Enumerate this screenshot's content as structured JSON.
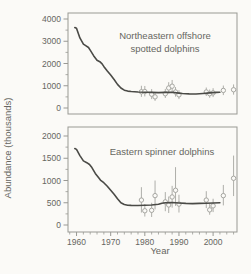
{
  "figure": {
    "y_axis_label": "Abundance (thousands)",
    "x_axis_label": "Year",
    "colors": {
      "background": "#fbfaf7",
      "frame": "#999994",
      "tick_text": "#66665f",
      "model_line": "#4a4a46",
      "survey_marker": "#a6a6a1",
      "error_bar": "#aeaea9"
    }
  },
  "chart_data": [
    {
      "type": "line",
      "title": "Northeastern offshore spotted dolphins",
      "title_lines": [
        "Northeastern offshore",
        "spotted dolphins"
      ],
      "ylabel": "Abundance (thousands)",
      "xlabel": "Year",
      "ylim": [
        0,
        4000
      ],
      "yticks": [
        0,
        1000,
        2000,
        3000,
        4000
      ],
      "y_minor_ticks": [
        500,
        1500,
        2500,
        3500
      ],
      "xlim": [
        1957.5,
        2007
      ],
      "xticks": [
        1960,
        1970,
        1980,
        1990,
        2000
      ],
      "x_minor_step": 2,
      "grid": false,
      "series": [
        {
          "name": "model-trajectory",
          "type": "line",
          "x": [
            1959.5,
            1960,
            1961,
            1962,
            1962.8,
            1963.5,
            1964,
            1965,
            1966,
            1966.8,
            1967.5,
            1968,
            1969,
            1970,
            1971,
            1972,
            1973,
            1974,
            1975,
            1976,
            1978,
            1980,
            1982,
            1984,
            1986,
            1988,
            1990,
            1991,
            1993,
            1995,
            1997,
            1999,
            2001,
            2002
          ],
          "y": [
            3620,
            3580,
            3150,
            2870,
            2790,
            2720,
            2600,
            2350,
            2150,
            2080,
            1980,
            1870,
            1660,
            1480,
            1280,
            1060,
            900,
            800,
            760,
            740,
            720,
            710,
            700,
            690,
            700,
            710,
            670,
            650,
            635,
            630,
            650,
            680,
            700,
            710
          ]
        },
        {
          "name": "survey-estimates-95ci",
          "type": "scatter-error",
          "x": [
            1979,
            1980,
            1982,
            1983,
            1986,
            1987,
            1988,
            1989,
            1990,
            1998,
            1999,
            2000,
            2003,
            2006
          ],
          "y": [
            730,
            740,
            620,
            500,
            640,
            900,
            980,
            720,
            590,
            720,
            640,
            680,
            790,
            820
          ],
          "lo": [
            500,
            520,
            400,
            320,
            450,
            650,
            710,
            510,
            400,
            540,
            460,
            490,
            580,
            600
          ],
          "hi": [
            1000,
            990,
            850,
            700,
            860,
            1160,
            1260,
            940,
            800,
            920,
            830,
            890,
            1010,
            1060
          ]
        }
      ]
    },
    {
      "type": "line",
      "title": "Eastern spinner dolphins",
      "title_lines": [
        "Eastern spinner dolphins"
      ],
      "ylabel": "Abundance (thousands)",
      "xlabel": "Year",
      "ylim": [
        0,
        2000
      ],
      "yticks": [
        0,
        500,
        1000,
        1500,
        2000
      ],
      "y_minor_ticks": [
        250,
        750,
        1250,
        1750
      ],
      "xlim": [
        1957.5,
        2007
      ],
      "xticks": [
        1960,
        1970,
        1980,
        1990,
        2000
      ],
      "x_minor_step": 2,
      "grid": false,
      "series": [
        {
          "name": "model-trajectory",
          "type": "line",
          "x": [
            1959.5,
            1960,
            1961,
            1962,
            1963,
            1963.8,
            1964.5,
            1965.5,
            1966.5,
            1967,
            1968,
            1969,
            1970,
            1971,
            1972,
            1973,
            1974,
            1975,
            1976,
            1978,
            1980,
            1982,
            1984,
            1985,
            1986,
            1988,
            1990,
            1992,
            1994,
            1996,
            1998,
            2000,
            2002
          ],
          "y": [
            1720,
            1700,
            1560,
            1440,
            1400,
            1360,
            1290,
            1160,
            1060,
            1010,
            950,
            870,
            780,
            690,
            590,
            500,
            460,
            445,
            440,
            438,
            445,
            450,
            465,
            490,
            500,
            505,
            495,
            485,
            482,
            485,
            490,
            495,
            500
          ]
        },
        {
          "name": "survey-estimates-95ci",
          "type": "scatter-error",
          "x": [
            1979,
            1980,
            1982,
            1983,
            1986,
            1987,
            1988,
            1989,
            1990,
            1998,
            1999,
            2000,
            2003,
            2006
          ],
          "y": [
            560,
            320,
            330,
            660,
            520,
            450,
            630,
            780,
            470,
            560,
            340,
            430,
            660,
            1050
          ],
          "lo": [
            280,
            190,
            180,
            350,
            310,
            270,
            390,
            430,
            280,
            380,
            230,
            290,
            440,
            650
          ],
          "hi": [
            850,
            470,
            500,
            1000,
            740,
            640,
            880,
            1300,
            680,
            760,
            480,
            590,
            900,
            1560
          ]
        }
      ]
    }
  ]
}
